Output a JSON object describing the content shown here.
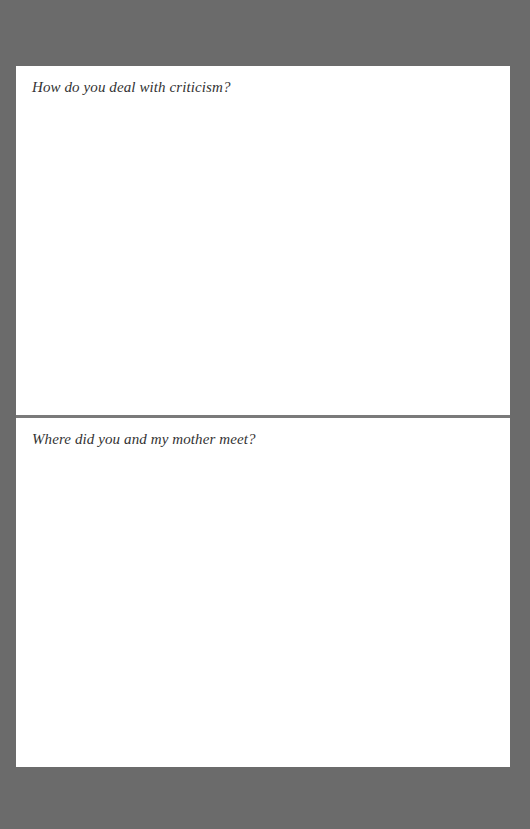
{
  "page": {
    "background_color": "#6b6b6b",
    "paper_color": "#ffffff",
    "divider_color": "#7a7a7a"
  },
  "questions": [
    {
      "prompt": "How do you deal with criticism?",
      "answer": ""
    },
    {
      "prompt": "Where did you and my mother meet?",
      "answer": ""
    }
  ]
}
